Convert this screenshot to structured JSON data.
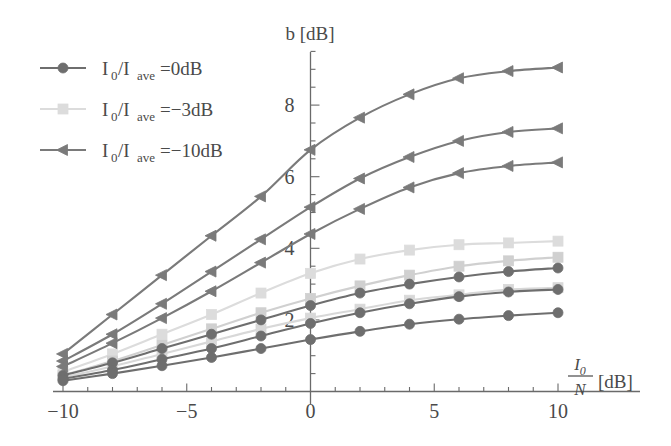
{
  "chart_data": {
    "type": "line",
    "title": "",
    "ylabel": "b [dB]",
    "xlabel": "I0/N [dB]",
    "xlabel_numerator": "I",
    "xlabel_numerator_sub": "0",
    "xlabel_denominator": "N",
    "xlabel_units": "[dB]",
    "xlim": [
      -10,
      10
    ],
    "ylim": [
      0,
      9.6
    ],
    "grid": false,
    "legend_position": "upper-left",
    "x_ticks": [
      -10,
      -5,
      0,
      5,
      10
    ],
    "x_tick_labels": [
      "−10",
      "−5",
      "0",
      "5",
      "10"
    ],
    "x_minor_tick_step": 1,
    "y_ticks": [
      2,
      4,
      6,
      8
    ],
    "y_tick_labels": [
      "2",
      "4",
      "6",
      "8"
    ],
    "y_minor_tick_step": 0.5,
    "x": [
      -10,
      -8,
      -6,
      -4,
      -2,
      0,
      2,
      4,
      6,
      8,
      10
    ],
    "series": [
      {
        "name": "I0/Iave=-10dB (upper)",
        "group": "I0/Iave=-10dB",
        "marker": "triangle-left",
        "color": "#7a7a7a",
        "values": [
          1.05,
          2.15,
          3.25,
          4.35,
          5.45,
          6.75,
          7.65,
          8.3,
          8.75,
          8.95,
          9.05
        ]
      },
      {
        "name": "I0/Iave=-10dB (middle)",
        "group": "I0/Iave=-10dB",
        "marker": "triangle-left",
        "color": "#7a7a7a",
        "values": [
          0.85,
          1.6,
          2.45,
          3.35,
          4.25,
          5.15,
          5.95,
          6.55,
          7.0,
          7.25,
          7.35
        ]
      },
      {
        "name": "I0/Iave=-10dB (lower)",
        "group": "I0/Iave=-10dB",
        "marker": "triangle-left",
        "color": "#7a7a7a",
        "values": [
          0.7,
          1.35,
          2.05,
          2.8,
          3.6,
          4.4,
          5.1,
          5.7,
          6.1,
          6.3,
          6.4
        ]
      },
      {
        "name": "I0/Iave=-3dB (upper)",
        "group": "I0/Iave=-3dB",
        "marker": "square",
        "color": "#dcdcdc",
        "values": [
          0.55,
          1.05,
          1.6,
          2.15,
          2.75,
          3.3,
          3.7,
          3.95,
          4.1,
          4.15,
          4.2
        ]
      },
      {
        "name": "I0/Iave=-3dB (middle)",
        "group": "I0/Iave=-3dB",
        "marker": "square",
        "color": "#d0d0d0",
        "values": [
          0.45,
          0.85,
          1.3,
          1.75,
          2.2,
          2.6,
          2.95,
          3.25,
          3.5,
          3.65,
          3.75
        ]
      },
      {
        "name": "I0/Iave=-3dB (lower)",
        "group": "I0/Iave=-3dB",
        "marker": "square",
        "color": "#d8d8d8",
        "values": [
          0.4,
          0.7,
          1.05,
          1.4,
          1.75,
          2.05,
          2.3,
          2.55,
          2.7,
          2.85,
          2.9
        ]
      },
      {
        "name": "I0/Iave=0dB (upper)",
        "group": "I0/Iave=0dB",
        "marker": "circle",
        "color": "#6e6e6e",
        "values": [
          0.45,
          0.8,
          1.2,
          1.6,
          2.0,
          2.4,
          2.75,
          3.0,
          3.2,
          3.35,
          3.45
        ]
      },
      {
        "name": "I0/Iave=0dB (middle)",
        "group": "I0/Iave=0dB",
        "marker": "circle",
        "color": "#6e6e6e",
        "values": [
          0.35,
          0.6,
          0.9,
          1.2,
          1.55,
          1.9,
          2.2,
          2.45,
          2.65,
          2.78,
          2.85
        ]
      },
      {
        "name": "I0/Iave=0dB (lower)",
        "group": "I0/Iave=0dB",
        "marker": "circle",
        "color": "#6e6e6e",
        "values": [
          0.3,
          0.5,
          0.72,
          0.95,
          1.2,
          1.45,
          1.68,
          1.88,
          2.02,
          2.12,
          2.2
        ]
      }
    ]
  },
  "legend": {
    "items": [
      {
        "marker": "circle",
        "color": "#6e6e6e",
        "prefix": "I",
        "prefix_sub": "0",
        "slash": "/I",
        "slash_sub": "ave",
        "value": "=0dB"
      },
      {
        "marker": "square",
        "color": "#dcdcdc",
        "prefix": "I",
        "prefix_sub": "0",
        "slash": "/I",
        "slash_sub": "ave",
        "value": "=−3dB"
      },
      {
        "marker": "triangle-left",
        "color": "#7a7a7a",
        "prefix": "I",
        "prefix_sub": "0",
        "slash": "/I",
        "slash_sub": "ave",
        "value": "=−10dB"
      }
    ]
  },
  "axes": {
    "y_axis_title": "b [dB]"
  },
  "colors": {
    "axis": "#6a6a6a",
    "dark_series": "#6e6e6e",
    "mid_series": "#7a7a7a",
    "light_series": "#dcdcdc",
    "text": "#4a4a4a",
    "background": "#ffffff"
  }
}
